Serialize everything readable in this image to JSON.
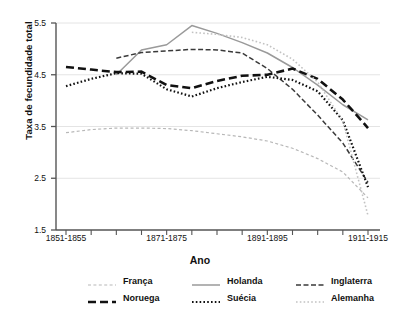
{
  "chart_data": {
    "type": "line",
    "title": "",
    "xlabel": "Ano",
    "ylabel": "Taxa de fecundidade total",
    "ylim": [
      1.5,
      5.5
    ],
    "yticks": [
      1.5,
      2.5,
      3.5,
      4.5,
      5.5
    ],
    "ytick_labels": [
      "1.5",
      "2.5",
      "3.5",
      "4.5",
      "5.5"
    ],
    "grid": "horizontal",
    "legend_position": "bottom",
    "x": [
      "1851-1855",
      "1856-1860",
      "1861-1865",
      "1866-1870",
      "1871-1875",
      "1876-1880",
      "1881-1885",
      "1886-1890",
      "1891-1895",
      "1896-1900",
      "1901-1905",
      "1906-1910",
      "1911-1915"
    ],
    "xtick_labels": [
      "1851-1855",
      "1871-1875",
      "1891-1895",
      "1911-1915"
    ],
    "series": [
      {
        "name": "Franca",
        "label": "França",
        "style": "dashed-light",
        "color": "#b8b8b8",
        "x": [
          "1851-1855",
          "1856-1860",
          "1861-1865",
          "1866-1870",
          "1871-1875",
          "1876-1880",
          "1881-1885",
          "1886-1890",
          "1891-1895",
          "1896-1900",
          "1901-1905",
          "1906-1910",
          "1911-1915"
        ],
        "values": [
          3.38,
          3.44,
          3.47,
          3.47,
          3.46,
          3.42,
          3.36,
          3.3,
          3.22,
          3.08,
          2.88,
          2.62,
          2.12
        ]
      },
      {
        "name": "Holanda",
        "label": "Holanda",
        "style": "solid-gray",
        "color": "#9a9a9a",
        "x": [
          "1861-1865",
          "1866-1870",
          "1871-1875",
          "1876-1880",
          "1881-1885",
          "1886-1890",
          "1891-1895",
          "1896-1900",
          "1901-1905",
          "1906-1910",
          "1911-1915"
        ],
        "values": [
          4.5,
          4.98,
          5.08,
          5.45,
          5.3,
          5.12,
          4.92,
          4.64,
          4.3,
          3.92,
          3.63
        ]
      },
      {
        "name": "Inglaterra",
        "label": "Inglaterra",
        "style": "dashed-dark",
        "color": "#3a3a3a",
        "x": [
          "1861-1865",
          "1866-1870",
          "1871-1875",
          "1876-1880",
          "1881-1885",
          "1886-1890",
          "1891-1895",
          "1896-1900",
          "1901-1905",
          "1906-1910",
          "1911-1915"
        ],
        "values": [
          4.82,
          4.93,
          4.96,
          4.99,
          4.98,
          4.92,
          4.62,
          4.22,
          3.72,
          3.18,
          2.42
        ]
      },
      {
        "name": "Noruega",
        "label": "Noruega",
        "style": "longdash-black",
        "color": "#111111",
        "x": [
          "1851-1855",
          "1856-1860",
          "1861-1865",
          "1866-1870",
          "1871-1875",
          "1876-1880",
          "1881-1885",
          "1886-1890",
          "1891-1895",
          "1896-1900",
          "1901-1905",
          "1906-1910",
          "1911-1915"
        ],
        "values": [
          4.65,
          4.6,
          4.55,
          4.56,
          4.3,
          4.24,
          4.38,
          4.48,
          4.5,
          4.62,
          4.42,
          4.02,
          3.47
        ]
      },
      {
        "name": "Suecia",
        "label": "Suécia",
        "style": "dotted-black",
        "color": "#111111",
        "x": [
          "1851-1855",
          "1856-1860",
          "1861-1865",
          "1866-1870",
          "1871-1875",
          "1876-1880",
          "1881-1885",
          "1886-1890",
          "1891-1895",
          "1896-1900",
          "1901-1905",
          "1906-1910",
          "1911-1915"
        ],
        "values": [
          4.28,
          4.42,
          4.53,
          4.52,
          4.22,
          4.08,
          4.24,
          4.36,
          4.46,
          4.4,
          4.18,
          3.62,
          2.33
        ]
      },
      {
        "name": "Alemanha",
        "label": "Alemanha",
        "style": "dotted-light",
        "color": "#c2c2c2",
        "x": [
          "1876-1880",
          "1881-1885",
          "1886-1890",
          "1891-1895",
          "1896-1900",
          "1901-1905",
          "1906-1910",
          "1911-1915"
        ],
        "values": [
          5.32,
          5.28,
          5.22,
          5.08,
          4.8,
          4.36,
          3.6,
          1.78
        ]
      }
    ]
  },
  "legend": {
    "rows": [
      [
        {
          "label": "França",
          "style": "dashed-light"
        },
        {
          "label": "Holanda",
          "style": "solid-gray"
        },
        {
          "label": "Inglaterra",
          "style": "dashed-dark"
        }
      ],
      [
        {
          "label": "Noruega",
          "style": "longdash-black"
        },
        {
          "label": "Suécia",
          "style": "dotted-black"
        },
        {
          "label": "Alemanha",
          "style": "dotted-light"
        }
      ]
    ]
  }
}
